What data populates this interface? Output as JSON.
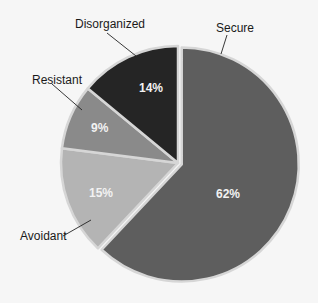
{
  "chart_data": {
    "type": "pie",
    "title": "",
    "categories": [
      "Secure",
      "Avoidant",
      "Resistant",
      "Disorganized"
    ],
    "values": [
      62,
      15,
      9,
      14
    ],
    "value_labels": [
      "62%",
      "15%",
      "9%",
      "14%"
    ],
    "colors": [
      "#5e5e5e",
      "#b4b4b4",
      "#8a8a8a",
      "#252525"
    ],
    "start_angle_deg": 0,
    "direction": "clockwise",
    "exploded": [
      "Secure"
    ],
    "legend": "none (leader-line labels)",
    "separator_color": "#d6d6d6"
  },
  "labels": {
    "secure": "Secure",
    "avoidant": "Avoidant",
    "resistant": "Resistant",
    "disorganized": "Disorganized"
  },
  "pct": {
    "secure": "62%",
    "avoidant": "15%",
    "resistant": "9%",
    "disorganized": "14%"
  }
}
